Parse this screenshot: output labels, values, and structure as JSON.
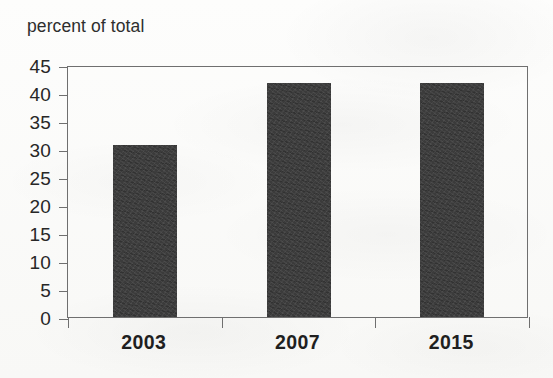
{
  "chart_data": {
    "type": "bar",
    "title": "percent of total",
    "xlabel": "",
    "ylabel": "percent of total",
    "categories": [
      "2003",
      "2007",
      "2015"
    ],
    "values": [
      30.8,
      41.7,
      41.7
    ],
    "ylim": [
      0,
      45
    ],
    "yticks": [
      0,
      5,
      10,
      15,
      20,
      25,
      30,
      35,
      40,
      45
    ],
    "ytick_labels": [
      "0",
      "5",
      "10",
      "15",
      "20",
      "25",
      "30",
      "35",
      "40",
      "45"
    ],
    "grid": false,
    "legend": null,
    "series": [
      {
        "name": "percent of total",
        "values": [
          30.8,
          41.7,
          41.7
        ],
        "color": "#3b3b3b"
      }
    ],
    "colors": {
      "bar": "#3b3b3b",
      "axis": "#6f6f6f",
      "text": "#272727",
      "background": "#fbfbfa"
    }
  }
}
